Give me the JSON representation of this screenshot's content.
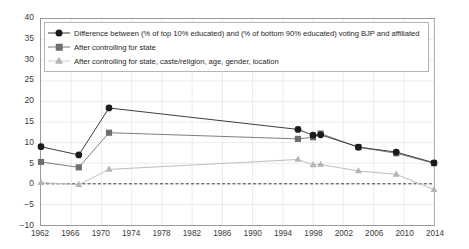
{
  "chart_data": {
    "type": "line",
    "title": "",
    "subtitle": "",
    "xlabel": "",
    "ylabel": "",
    "xlim": [
      1962,
      2014
    ],
    "ylim": [
      -10,
      40
    ],
    "yticks": [
      -10,
      -5,
      0,
      5,
      10,
      15,
      20,
      25,
      30,
      35,
      40
    ],
    "ytick_labels": [
      "−10",
      "−5",
      "0",
      "5",
      "10",
      "15",
      "20",
      "25",
      "30",
      "35",
      "40"
    ],
    "xticks": [
      1962,
      1966,
      1970,
      1974,
      1978,
      1982,
      1986,
      1990,
      1994,
      1998,
      2002,
      2006,
      2010,
      2014
    ],
    "xtick_labels": [
      "1962",
      "1966",
      "1970",
      "1974",
      "1978",
      "1982",
      "1986",
      "1990",
      "1994",
      "1998",
      "2002",
      "2006",
      "2010",
      "2014"
    ],
    "grid": true,
    "grid_color": "#e4e4e4",
    "legend_position": "top-left-inside",
    "zero_line": {
      "value": 0,
      "style": "dashed",
      "color": "#3a3a3a"
    },
    "series": [
      {
        "name": "Difference between (% of top 10% educated) and (% of bottom 90% educated) voting BJP and affiliated",
        "marker": "circle",
        "color": "#1a1a1a",
        "line_color": "#3c3c3c",
        "x": [
          1962,
          1967,
          1971,
          1996,
          1998,
          1999,
          2004,
          2009,
          2014
        ],
        "values": [
          9.0,
          7.0,
          18.4,
          13.2,
          11.8,
          11.9,
          8.9,
          7.7,
          5.1
        ]
      },
      {
        "name": "After controlling for state",
        "marker": "square",
        "color": "#6e6e6e",
        "line_color": "#7d7d7d",
        "x": [
          1962,
          1967,
          1971,
          1996,
          1998,
          1999,
          2004,
          2009,
          2014
        ],
        "values": [
          5.3,
          4.0,
          12.4,
          10.9,
          11.3,
          12.2,
          8.9,
          7.4,
          5.0
        ]
      },
      {
        "name": "After controlling for state, caste/religion, age, gender, location",
        "marker": "triangle",
        "color": "#b4b4b4",
        "line_color": "#bdbdbd",
        "x": [
          1962,
          1967,
          1971,
          1996,
          1998,
          1999,
          2004,
          2009,
          2014
        ],
        "values": [
          0.3,
          -0.2,
          3.5,
          5.9,
          4.6,
          4.7,
          3.1,
          2.3,
          -1.4
        ]
      }
    ]
  },
  "legend": {
    "items": [
      {
        "label": "Difference between (% of top 10% educated) and (% of bottom 90% educated) voting BJP and affiliated",
        "marker": "circle-marker"
      },
      {
        "label": "After controlling for state",
        "marker": "square-marker"
      },
      {
        "label": "After controlling for state, caste/religion, age, gender, location",
        "marker": "triangle-marker"
      }
    ]
  }
}
